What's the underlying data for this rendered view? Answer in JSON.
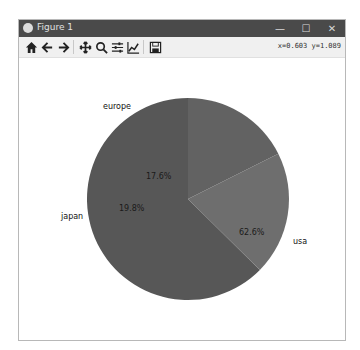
{
  "window": {
    "title": "Figure 1",
    "controls": {
      "minimize": "—",
      "maximize": "☐",
      "close": "✕"
    }
  },
  "toolbar": {
    "buttons": [
      {
        "name": "home-icon",
        "label": "Home"
      },
      {
        "name": "back-icon",
        "label": "Back"
      },
      {
        "name": "forward-icon",
        "label": "Forward"
      },
      {
        "name": "pan-icon",
        "label": "Pan"
      },
      {
        "name": "zoom-icon",
        "label": "Zoom"
      },
      {
        "name": "subplots-icon",
        "label": "Configure subplots"
      },
      {
        "name": "edit-axis-icon",
        "label": "Edit axis"
      },
      {
        "name": "save-icon",
        "label": "Save"
      }
    ],
    "coords": "x=0.603 y=1.089"
  },
  "chart_data": {
    "type": "pie",
    "title": "",
    "categories": [
      "usa",
      "japan",
      "europe"
    ],
    "values": [
      62.6,
      19.8,
      17.6
    ],
    "labels_pct": [
      "62.6%",
      "19.8%",
      "17.6%"
    ],
    "colors": [
      "#575757",
      "#6e6e6e",
      "#626262"
    ],
    "startangle": 90,
    "direction": "clockwise",
    "autopct": "%1.1f%%"
  }
}
